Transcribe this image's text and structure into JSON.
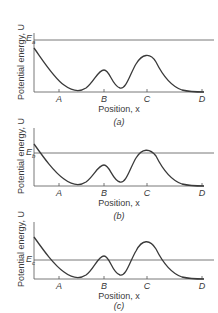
{
  "figure": {
    "panels": [
      {
        "id": "a",
        "caption": "(a)",
        "ylabel": "Potential energy, U",
        "xlabel": "Position, x",
        "energy_label": "E",
        "energy_sub": "a",
        "ticks": [
          "A",
          "B",
          "C",
          "D"
        ]
      },
      {
        "id": "b",
        "caption": "(b)",
        "ylabel": "Potential energy, U",
        "xlabel": "Position, x",
        "energy_label": "E",
        "energy_sub": "b",
        "ticks": [
          "A",
          "B",
          "C",
          "D"
        ]
      },
      {
        "id": "c",
        "caption": "(c)",
        "ylabel": "Potential energy, U",
        "xlabel": "Position, x",
        "energy_label": "E",
        "energy_sub": "c",
        "ticks": [
          "A",
          "B",
          "C",
          "D"
        ]
      }
    ],
    "colors": {
      "line": "#3a3a3a",
      "background": "#ffffff"
    }
  }
}
